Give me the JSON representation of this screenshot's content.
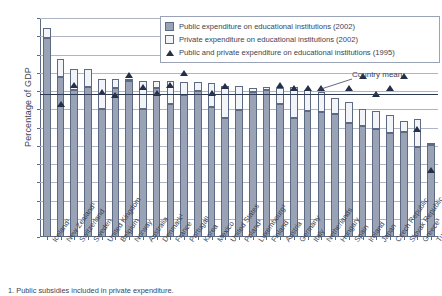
{
  "chart_data": {
    "type": "bar",
    "title": "",
    "subtitle": "",
    "xlabel": "",
    "ylabel": "Percentage of GDP",
    "ylim": [
      0.0,
      6.0
    ],
    "ytick_step": 0.5,
    "yticks": [
      "0.0",
      "0.5",
      "1.0",
      "1.5",
      "2.0",
      "2.5",
      "3.0",
      "3.5",
      "4.0",
      "4.5",
      "5.0",
      "5.5",
      "6.0"
    ],
    "grid": true,
    "legend_position": "top-right",
    "stacked": true,
    "categories": [
      "Iceland",
      "New Zealand",
      "Switzerland",
      "Sweden",
      "United Kingdom",
      "Belgium",
      "Norway",
      "Australia",
      "Denmark",
      "France",
      "Portugal",
      "Korea",
      "Mexico",
      "United States",
      "Poland",
      "Luxembourg",
      "Finland",
      "Austria",
      "Germany",
      "Italy",
      "Netherlands",
      "Hungary",
      "Spain",
      "Ireland",
      "Japan",
      "Czech Republic",
      "Slovak Republic",
      "Greece",
      "Turkey"
    ],
    "category_footnote_marks": [
      "Iceland 1",
      "New Zealand 1",
      "Denmark 1",
      "Portugal 1",
      "Poland 1",
      "Luxembourg 1",
      "Greece 1"
    ],
    "series": [
      {
        "name": "Public expenditure on educational institutions (2002)",
        "type": "bar-segment",
        "color": "#9aa3b5",
        "values": [
          5.45,
          4.38,
          4.04,
          4.12,
          3.51,
          4.08,
          4.27,
          3.52,
          4.09,
          3.64,
          3.89,
          3.99,
          3.55,
          3.26,
          3.49,
          3.98,
          4.02,
          3.65,
          3.25,
          3.46,
          3.43,
          3.38,
          3.12,
          3.04,
          2.97,
          2.84,
          2.88,
          2.47,
          2.53
        ]
      },
      {
        "name": "Private expenditure on educational institutions (2002)",
        "type": "bar-segment",
        "color": "#f2f4f8",
        "values": [
          0.28,
          0.49,
          0.56,
          0.48,
          0.81,
          0.24,
          0.02,
          0.76,
          0.19,
          0.63,
          0.37,
          0.26,
          0.66,
          0.89,
          0.65,
          0.11,
          0.09,
          0.44,
          0.85,
          0.57,
          0.53,
          0.42,
          0.57,
          0.47,
          0.49,
          0.49,
          0.31,
          0.75,
          0.04
        ]
      }
    ],
    "totals_2002": [
      5.73,
      4.87,
      4.6,
      4.6,
      4.32,
      4.32,
      4.29,
      4.28,
      4.28,
      4.27,
      4.26,
      4.25,
      4.21,
      4.15,
      4.14,
      4.09,
      4.11,
      4.09,
      4.1,
      4.03,
      3.96,
      3.8,
      3.69,
      3.51,
      3.46,
      3.33,
      3.19,
      3.22,
      2.57
    ],
    "marker_series": {
      "name": "Public and private expenditure on educational institutions (1995)",
      "type": "scatter-marker",
      "marker": "triangle",
      "color": "#243049",
      "values": [
        null,
        3.56,
        4.08,
        null,
        3.9,
        3.81,
        4.36,
        4.02,
        3.85,
        4.08,
        4.42,
        null,
        3.87,
        4.05,
        null,
        null,
        null,
        4.08,
        4.01,
        3.99,
        4.0,
        null,
        3.99,
        4.32,
        3.84,
        4.0,
        4.33,
        2.89,
        1.74
      ]
    },
    "annotations": [
      {
        "name": "country-mean-line",
        "label": "Country mean",
        "value": 3.92,
        "style": "horizontal-reference-line"
      }
    ],
    "footnote": "1. Public subsidies included in private expenditure."
  },
  "legend": {
    "items": [
      {
        "swatch": "public-swatch",
        "label": "Public expenditure on educational institutions (2002)"
      },
      {
        "swatch": "private-swatch",
        "label": "Private expenditure on educational institutions (2002)"
      },
      {
        "swatch": "marker-swatch",
        "label": "Public and private expenditure on educational institutions (1995)"
      }
    ]
  },
  "colors": {
    "public": "#9aa3b5",
    "private": "#f2f4f8",
    "marker": "#243049",
    "axis": "#5d6a84",
    "grid": "#aeb6c6",
    "text": "#3b4456"
  }
}
